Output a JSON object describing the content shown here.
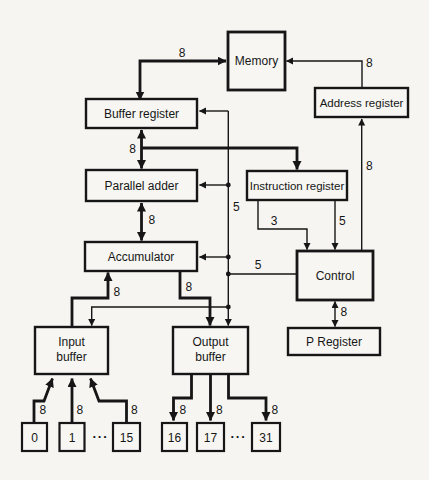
{
  "diagram": {
    "colors": {
      "ink": "#161616",
      "paper": "#f6f5f2"
    },
    "nodes": {
      "memory": {
        "label": "Memory"
      },
      "buffer_register": {
        "label": "Buffer register"
      },
      "address_register": {
        "label": "Address register"
      },
      "parallel_adder": {
        "label": "Parallel adder"
      },
      "instruction_register": {
        "label": "Instruction register"
      },
      "accumulator": {
        "label": "Accumulator"
      },
      "control": {
        "label": "Control"
      },
      "p_register": {
        "label": "P Register"
      },
      "input_buffer": {
        "line1": "Input",
        "line2": "buffer"
      },
      "output_buffer": {
        "line1": "Output",
        "line2": "buffer"
      },
      "input_ports": [
        "0",
        "1",
        "15"
      ],
      "output_ports": [
        "16",
        "17",
        "31"
      ],
      "input_ellipsis": "···",
      "output_ellipsis": "···"
    },
    "bus_labels": {
      "mem_buffer": "8",
      "mem_address": "8",
      "buffer_adder": "8",
      "adder_acc": "8",
      "ctrl_vertical": "5",
      "ir_decode": "3",
      "ir_opcode": "5",
      "addr_up": "8",
      "ctrl_to_control": "5",
      "acc_out": "8",
      "acc_in": "8",
      "ctrl_p": "8",
      "in0": "8",
      "in1": "8",
      "in15": "8",
      "out16": "8",
      "out17": "8",
      "out31": "8"
    }
  }
}
